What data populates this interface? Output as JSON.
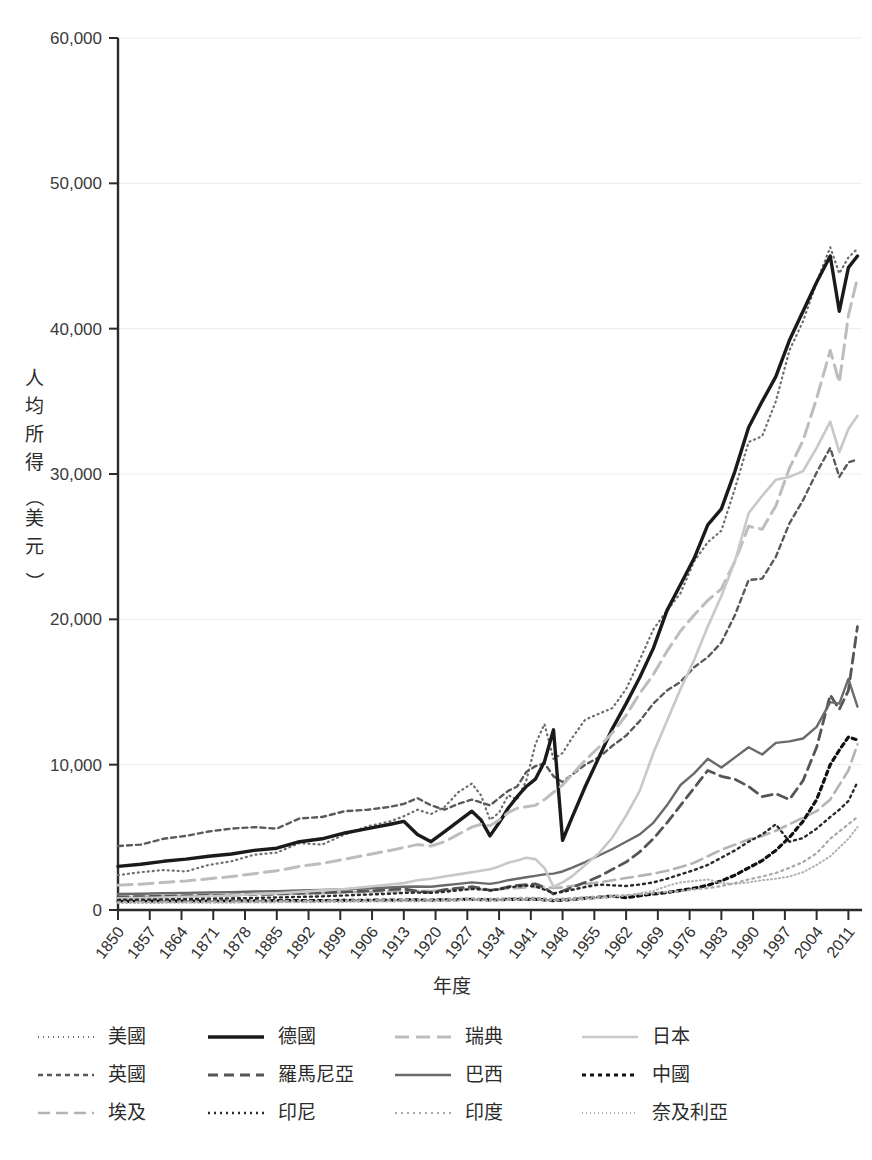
{
  "chart_data": {
    "type": "line",
    "title": "",
    "xlabel": "年度",
    "ylabel": "人均所得（美元）",
    "ylabel_chars": [
      "人",
      "均",
      "所",
      "得",
      "（",
      "美",
      "元",
      "）"
    ],
    "xlim": [
      1850,
      2014
    ],
    "ylim": [
      0,
      60000
    ],
    "grid": true,
    "grid_axis": "y",
    "legend_position": "bottom",
    "legend_columns": 4,
    "y_ticks": [
      0,
      10000,
      20000,
      30000,
      40000,
      50000,
      60000
    ],
    "y_tick_labels": [
      "0",
      "10,000",
      "20,000",
      "30,000",
      "40,000",
      "50,000",
      "60,000"
    ],
    "x_ticks": [
      1850,
      1857,
      1864,
      1871,
      1878,
      1885,
      1892,
      1899,
      1906,
      1913,
      1920,
      1927,
      1934,
      1941,
      1948,
      1955,
      1962,
      1969,
      1976,
      1983,
      1990,
      1997,
      2004,
      2011
    ],
    "x_tick_labels": [
      "1850",
      "1857",
      "1864",
      "1871",
      "1878",
      "1885",
      "1892",
      "1899",
      "1906",
      "1913",
      "1920",
      "1927",
      "1934",
      "1941",
      "1948",
      "1955",
      "1962",
      "1969",
      "1976",
      "1983",
      "1990",
      "1997",
      "2004",
      "2011"
    ],
    "x": [
      1850,
      1855,
      1860,
      1865,
      1870,
      1875,
      1880,
      1885,
      1890,
      1895,
      1900,
      1905,
      1910,
      1913,
      1916,
      1919,
      1922,
      1925,
      1928,
      1930,
      1932,
      1934,
      1936,
      1938,
      1940,
      1942,
      1944,
      1946,
      1948,
      1950,
      1953,
      1956,
      1959,
      1962,
      1965,
      1968,
      1971,
      1974,
      1977,
      1980,
      1983,
      1986,
      1989,
      1992,
      1995,
      1998,
      2001,
      2004,
      2007,
      2009,
      2011,
      2013
    ],
    "series": [
      {
        "name": "美國",
        "style": "dotted-fine",
        "color": "#6e6e6e",
        "width": 2.2,
        "dash": "1,4",
        "values": [
          2400,
          2600,
          2750,
          2650,
          3100,
          3350,
          3800,
          3950,
          4600,
          4500,
          5200,
          5750,
          6100,
          6450,
          6900,
          6600,
          7100,
          8100,
          8700,
          7900,
          6200,
          6700,
          7900,
          7600,
          8900,
          11400,
          12800,
          10400,
          10800,
          11800,
          13100,
          13500,
          13900,
          15200,
          17200,
          19300,
          20600,
          21800,
          24000,
          25300,
          26100,
          29000,
          32200,
          32600,
          35000,
          38500,
          40500,
          43200,
          45600,
          43800,
          44900,
          45500
        ]
      },
      {
        "name": "英國",
        "style": "dotted-medium",
        "color": "#5a5a5a",
        "width": 2.4,
        "dash": "5,4",
        "values": [
          4400,
          4500,
          4900,
          5100,
          5400,
          5600,
          5700,
          5600,
          6300,
          6400,
          6800,
          6900,
          7100,
          7300,
          7700,
          7200,
          6900,
          7300,
          7600,
          7400,
          7200,
          7700,
          8200,
          8500,
          9500,
          9900,
          10100,
          9200,
          8800,
          9300,
          10000,
          10500,
          11300,
          12000,
          13000,
          14200,
          15100,
          15700,
          16700,
          17400,
          18400,
          20300,
          22700,
          22800,
          24300,
          26600,
          28200,
          30100,
          31800,
          29800,
          30800,
          31000
        ]
      },
      {
        "name": "埃及",
        "style": "dashed-long-light",
        "color": "#b4b4b4",
        "width": 2.6,
        "dash": "12,6",
        "values": [
          900,
          920,
          950,
          980,
          1010,
          1030,
          1060,
          1080,
          1120,
          1150,
          1200,
          1230,
          1280,
          1300,
          1320,
          1300,
          1350,
          1400,
          1450,
          1420,
          1380,
          1420,
          1480,
          1510,
          1560,
          1600,
          1580,
          1520,
          1560,
          1650,
          1780,
          1900,
          2050,
          2200,
          2350,
          2500,
          2700,
          2950,
          3250,
          3700,
          4150,
          4500,
          4850,
          5100,
          5450,
          5900,
          6350,
          6800,
          7600,
          8600,
          9600,
          11400
        ]
      },
      {
        "name": "德國",
        "style": "solid-thick",
        "color": "#1a1a1a",
        "width": 3.4,
        "dash": "",
        "values": [
          3000,
          3150,
          3350,
          3500,
          3700,
          3850,
          4100,
          4250,
          4700,
          4900,
          5300,
          5600,
          5900,
          6100,
          5200,
          4700,
          5400,
          6100,
          6800,
          6200,
          5100,
          6000,
          7000,
          7800,
          8500,
          9000,
          10200,
          12400,
          4800,
          6300,
          8500,
          10500,
          12500,
          14200,
          16000,
          18000,
          20600,
          22400,
          24200,
          26500,
          27600,
          30200,
          33200,
          35000,
          36700,
          39200,
          41200,
          43200,
          45000,
          41200,
          44200,
          45000
        ]
      },
      {
        "name": "羅馬尼亞",
        "style": "dashed-medium-dark",
        "color": "#555555",
        "width": 2.8,
        "dash": "10,6",
        "values": [
          900,
          920,
          950,
          980,
          1000,
          1030,
          1070,
          1100,
          1150,
          1180,
          1250,
          1300,
          1400,
          1450,
          1300,
          1200,
          1400,
          1500,
          1600,
          1500,
          1350,
          1450,
          1600,
          1700,
          1750,
          1800,
          1550,
          1100,
          1300,
          1550,
          1900,
          2300,
          2800,
          3300,
          4000,
          4900,
          6000,
          7200,
          8400,
          9600,
          9200,
          9000,
          8500,
          7800,
          8000,
          7600,
          8900,
          11200,
          14800,
          13800,
          15100,
          19500
        ]
      },
      {
        "name": "巴西",
        "style": "solid-medium",
        "color": "#6a6a6a",
        "width": 2.4,
        "dash": "",
        "values": [
          1100,
          1120,
          1150,
          1180,
          1200,
          1230,
          1270,
          1300,
          1350,
          1380,
          1430,
          1480,
          1550,
          1600,
          1620,
          1600,
          1700,
          1800,
          1900,
          1850,
          1800,
          1900,
          2050,
          2150,
          2250,
          2350,
          2450,
          2500,
          2650,
          2900,
          3300,
          3750,
          4200,
          4700,
          5200,
          6000,
          7200,
          8600,
          9400,
          10400,
          9800,
          10500,
          11200,
          10700,
          11500,
          11600,
          11800,
          12600,
          14300,
          14200,
          15900,
          14000
        ]
      },
      {
        "name": "瑞典",
        "style": "dashed-light",
        "color": "#bdbdbd",
        "width": 3.0,
        "dash": "14,7",
        "values": [
          1700,
          1780,
          1900,
          2000,
          2150,
          2300,
          2500,
          2700,
          3000,
          3200,
          3500,
          3800,
          4100,
          4300,
          4500,
          4400,
          4700,
          5200,
          5700,
          5900,
          5800,
          6200,
          6700,
          7000,
          7100,
          7200,
          7600,
          8100,
          8600,
          9300,
          10300,
          11200,
          12200,
          13400,
          14900,
          16200,
          17800,
          19200,
          20300,
          21300,
          22100,
          24000,
          26400,
          26200,
          27800,
          30400,
          32300,
          35200,
          38500,
          36300,
          40900,
          43500
        ]
      },
      {
        "name": "日本",
        "style": "solid-light",
        "color": "#c8c8c8",
        "width": 2.6,
        "dash": "",
        "values": [
          800,
          820,
          860,
          900,
          950,
          1000,
          1080,
          1150,
          1250,
          1350,
          1450,
          1600,
          1750,
          1850,
          2050,
          2150,
          2300,
          2450,
          2600,
          2700,
          2800,
          3000,
          3250,
          3400,
          3600,
          3500,
          2900,
          1600,
          1900,
          2300,
          3100,
          3900,
          5000,
          6500,
          8200,
          10800,
          13000,
          15200,
          17200,
          19500,
          21600,
          24000,
          27300,
          28500,
          29600,
          29800,
          30200,
          31800,
          33600,
          31500,
          33100,
          34000
        ]
      },
      {
        "name": "中國",
        "style": "dotted-thick-black",
        "color": "#111111",
        "width": 3.2,
        "dash": "4,4",
        "values": [
          600,
          600,
          610,
          610,
          620,
          620,
          630,
          640,
          650,
          650,
          660,
          670,
          680,
          690,
          690,
          680,
          700,
          720,
          730,
          720,
          700,
          710,
          730,
          740,
          740,
          730,
          700,
          650,
          680,
          720,
          800,
          880,
          950,
          850,
          980,
          1100,
          1200,
          1350,
          1500,
          1700,
          2000,
          2400,
          2900,
          3400,
          4100,
          5000,
          6100,
          7600,
          10000,
          11000,
          11900,
          11700
        ]
      },
      {
        "name": "印尼",
        "style": "dotted-fine-dark",
        "color": "#2a2a2a",
        "width": 2.4,
        "dash": "2,4",
        "values": [
          700,
          710,
          730,
          750,
          780,
          800,
          830,
          860,
          900,
          940,
          1000,
          1060,
          1120,
          1180,
          1200,
          1180,
          1250,
          1350,
          1450,
          1420,
          1350,
          1420,
          1550,
          1620,
          1680,
          1620,
          1400,
          1150,
          1250,
          1380,
          1580,
          1750,
          1700,
          1650,
          1750,
          1900,
          2150,
          2450,
          2750,
          3100,
          3600,
          4100,
          4700,
          5200,
          5900,
          4700,
          4950,
          5600,
          6400,
          6900,
          7500,
          8800
        ]
      },
      {
        "name": "印度",
        "style": "dotted-fine-gray",
        "color": "#a8a8a8",
        "width": 2.2,
        "dash": "2,4",
        "values": [
          550,
          560,
          570,
          580,
          590,
          600,
          610,
          620,
          630,
          640,
          660,
          680,
          700,
          710,
          720,
          700,
          730,
          760,
          790,
          780,
          760,
          780,
          810,
          830,
          840,
          830,
          800,
          750,
          780,
          820,
          880,
          930,
          990,
          1020,
          1080,
          1150,
          1250,
          1300,
          1420,
          1500,
          1650,
          1850,
          2100,
          2300,
          2550,
          2900,
          3300,
          3900,
          4900,
          5400,
          5900,
          6400
        ]
      },
      {
        "name": "奈及利亞",
        "style": "dotted-superfine",
        "color": "#b0b0b0",
        "width": 2.0,
        "dash": "1,3",
        "values": [
          480,
          485,
          490,
          495,
          500,
          505,
          515,
          525,
          535,
          545,
          560,
          575,
          590,
          600,
          610,
          600,
          625,
          650,
          675,
          665,
          650,
          665,
          690,
          705,
          715,
          705,
          685,
          650,
          670,
          700,
          760,
          820,
          900,
          1000,
          1150,
          1300,
          1650,
          1900,
          2000,
          2100,
          1850,
          1800,
          1900,
          2050,
          2150,
          2300,
          2600,
          3100,
          3700,
          4300,
          4900,
          5700
        ]
      }
    ]
  },
  "legend": {
    "rows": [
      [
        {
          "label": "美國",
          "series": 0
        },
        {
          "label": "德國",
          "series": 3
        },
        {
          "label": "瑞典",
          "series": 6
        },
        {
          "label": "日本",
          "series": 7
        }
      ],
      [
        {
          "label": "英國",
          "series": 1
        },
        {
          "label": "羅馬尼亞",
          "series": 4
        },
        {
          "label": "巴西",
          "series": 5
        },
        {
          "label": "中國",
          "series": 8
        }
      ],
      [
        {
          "label": "埃及",
          "series": 2
        },
        {
          "label": "印尼",
          "series": 9
        },
        {
          "label": "印度",
          "series": 10
        },
        {
          "label": "奈及利亞",
          "series": 11
        }
      ]
    ]
  },
  "colors": {
    "background": "#ffffff",
    "axis": "#2b2b2b",
    "grid": "#ececec",
    "text": "#2b2b2b"
  }
}
